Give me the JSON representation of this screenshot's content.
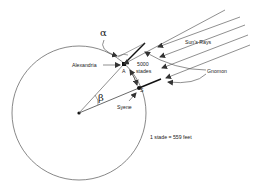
{
  "diagram": {
    "labels": {
      "alpha": "α",
      "beta": "β",
      "alexandria": "Alexandria",
      "point_a": "A",
      "syene": "Syene",
      "point_s": "S",
      "distance": "5000",
      "distance_unit": "stades",
      "suns_rays": "Sun's Rays",
      "gnomon": "Gnomon",
      "conversion": "1 stade = 559 feet"
    },
    "colors": {
      "line": "#333333",
      "background": "#ffffff"
    }
  }
}
